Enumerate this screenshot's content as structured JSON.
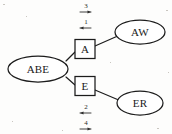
{
  "diagram": {
    "type": "node-link-graph",
    "title": "",
    "background_color": "#fdfdfc",
    "stroke_color": "#1c1c1c",
    "nodes": [
      {
        "id": "abe",
        "label": "ABE",
        "shape": "ellipse",
        "cx": 38,
        "cy": 69,
        "rx": 30,
        "ry": 13
      },
      {
        "id": "a",
        "label": "A",
        "shape": "rect",
        "cx": 85,
        "cy": 49,
        "w": 20,
        "h": 19
      },
      {
        "id": "e",
        "label": "E",
        "shape": "rect",
        "cx": 85,
        "cy": 86,
        "w": 20,
        "h": 19
      },
      {
        "id": "aw",
        "label": "AW",
        "shape": "ellipse",
        "cx": 140,
        "cy": 32,
        "rx": 25,
        "ry": 12
      },
      {
        "id": "er",
        "label": "ER",
        "shape": "ellipse",
        "cx": 140,
        "cy": 103,
        "rx": 23,
        "ry": 12
      }
    ],
    "edges": [
      {
        "id": "abe-a",
        "from": "abe",
        "to": "a"
      },
      {
        "id": "abe-e",
        "from": "abe",
        "to": "e"
      },
      {
        "id": "a-aw",
        "from": "a",
        "to": "aw"
      },
      {
        "id": "e-er",
        "from": "e",
        "to": "er"
      }
    ],
    "annotations": [
      {
        "id": "annot-top-3",
        "label": "3",
        "direction": "right",
        "x": 86,
        "y": 9
      },
      {
        "id": "annot-top-1",
        "label": "1",
        "direction": "left",
        "x": 86,
        "y": 25
      },
      {
        "id": "annot-bottom-2",
        "label": "2",
        "direction": "left",
        "x": 86,
        "y": 110
      },
      {
        "id": "annot-bottom-4",
        "label": "4",
        "direction": "right",
        "x": 86,
        "y": 126
      }
    ]
  }
}
